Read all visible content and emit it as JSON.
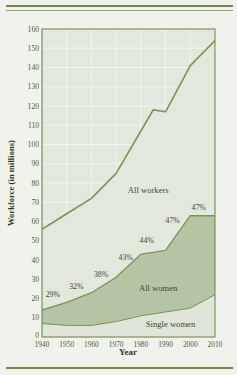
{
  "figure": {
    "background_color": "#f1f2ec",
    "rule_color": "#6f8a4f",
    "plot_bg_color": "#e2e8dc",
    "band_all_women_color": "#b5c4a5",
    "band_single_women_color": "#dfe5d8",
    "line_color": "#7d9455",
    "grid_color": "#ffffff",
    "axis_color": "#6f8a4f"
  },
  "chart_data": {
    "type": "area",
    "stacked": true,
    "title": "",
    "xlabel": "Year",
    "ylabel": "Workforce (in millions)",
    "xlim": [
      1940,
      2010
    ],
    "ylim": [
      0,
      160
    ],
    "grid": true,
    "legend_position": "inline-annotations",
    "x": [
      1940,
      1950,
      1960,
      1970,
      1980,
      1985,
      1990,
      2000,
      2010
    ],
    "xticks": [
      1940,
      1950,
      1960,
      1970,
      1980,
      1990,
      2000,
      2010
    ],
    "xtick_labels": [
      "1940",
      "1950",
      "1960",
      "1970",
      "1980",
      "1990",
      "2000",
      "2010"
    ],
    "yticks": [
      0,
      10,
      20,
      30,
      40,
      50,
      60,
      70,
      80,
      90,
      100,
      110,
      120,
      130,
      140,
      150,
      160
    ],
    "ytick_labels": [
      "0",
      "10",
      "20",
      "30",
      "40",
      "50",
      "60",
      "70",
      "80",
      "90",
      "100",
      "110",
      "120",
      "130",
      "140",
      "150",
      "160"
    ],
    "origin_label": "0",
    "series": [
      {
        "name": "All workers",
        "label": "All workers",
        "values": [
          56,
          64,
          72,
          85,
          107,
          118,
          117,
          141,
          154
        ]
      },
      {
        "name": "All women",
        "label": "All women",
        "values": [
          14,
          18,
          23,
          31,
          43,
          44,
          45,
          63,
          63
        ]
      },
      {
        "name": "Single women",
        "label": "Single women",
        "values": [
          7,
          6,
          6,
          8,
          11,
          12,
          13,
          15,
          22
        ]
      }
    ],
    "annotations": [
      {
        "text": "29%",
        "x": 1941.5,
        "y": 21
      },
      {
        "text": "32%",
        "x": 1951.0,
        "y": 25
      },
      {
        "text": "38%",
        "x": 1961.0,
        "y": 31
      },
      {
        "text": "43%",
        "x": 1971.0,
        "y": 40
      },
      {
        "text": "44%",
        "x": 1979.5,
        "y": 49
      },
      {
        "text": "47%",
        "x": 1990.0,
        "y": 59
      },
      {
        "text": "47%",
        "x": 2000.5,
        "y": 66
      }
    ],
    "area_labels": [
      {
        "text": "All workers",
        "x": 1983,
        "y": 75
      },
      {
        "text": "All women",
        "x": 1987,
        "y": 24
      },
      {
        "text": "Single women",
        "x": 1992,
        "y": 5
      }
    ]
  }
}
